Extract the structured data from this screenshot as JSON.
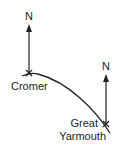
{
  "diagram": {
    "type": "bearing-sketch",
    "places": [
      {
        "name": "Cromer",
        "label": "Cromer",
        "x": 29,
        "y": 73,
        "north_label": "N"
      },
      {
        "name": "Great Yarmouth",
        "label_line1": "Great",
        "label_line2": "Yarmouth",
        "x": 106,
        "y": 124,
        "north_label": "N"
      }
    ],
    "coastline": "curved path from Cromer to Great Yarmouth",
    "colors": {
      "ink": "#222222",
      "background": "#ffffff"
    }
  }
}
